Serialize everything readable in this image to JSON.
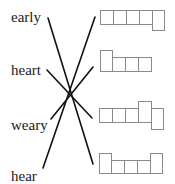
{
  "words": [
    {
      "text": "early",
      "top": 9
    },
    {
      "text": "heart",
      "top": 62
    },
    {
      "text": "weary",
      "top": 117
    },
    {
      "text": "hear",
      "top": 168
    }
  ],
  "lines": [
    {
      "from": "early",
      "to": "box-4",
      "x1": 48,
      "y1": 18,
      "x2": 93,
      "y2": 164
    },
    {
      "from": "hear",
      "to": "box-1",
      "x1": 43,
      "y1": 168,
      "x2": 95,
      "y2": 17
    },
    {
      "from": "heart",
      "to": "box-3",
      "x1": 47,
      "y1": 70,
      "x2": 92,
      "y2": 118
    },
    {
      "from": "weary",
      "to": "box-2",
      "x1": 51,
      "y1": 119,
      "x2": 93,
      "y2": 67
    }
  ],
  "colors": {
    "line": "#111111",
    "box": "#8a8a8a",
    "text": "#1a1a1a"
  }
}
